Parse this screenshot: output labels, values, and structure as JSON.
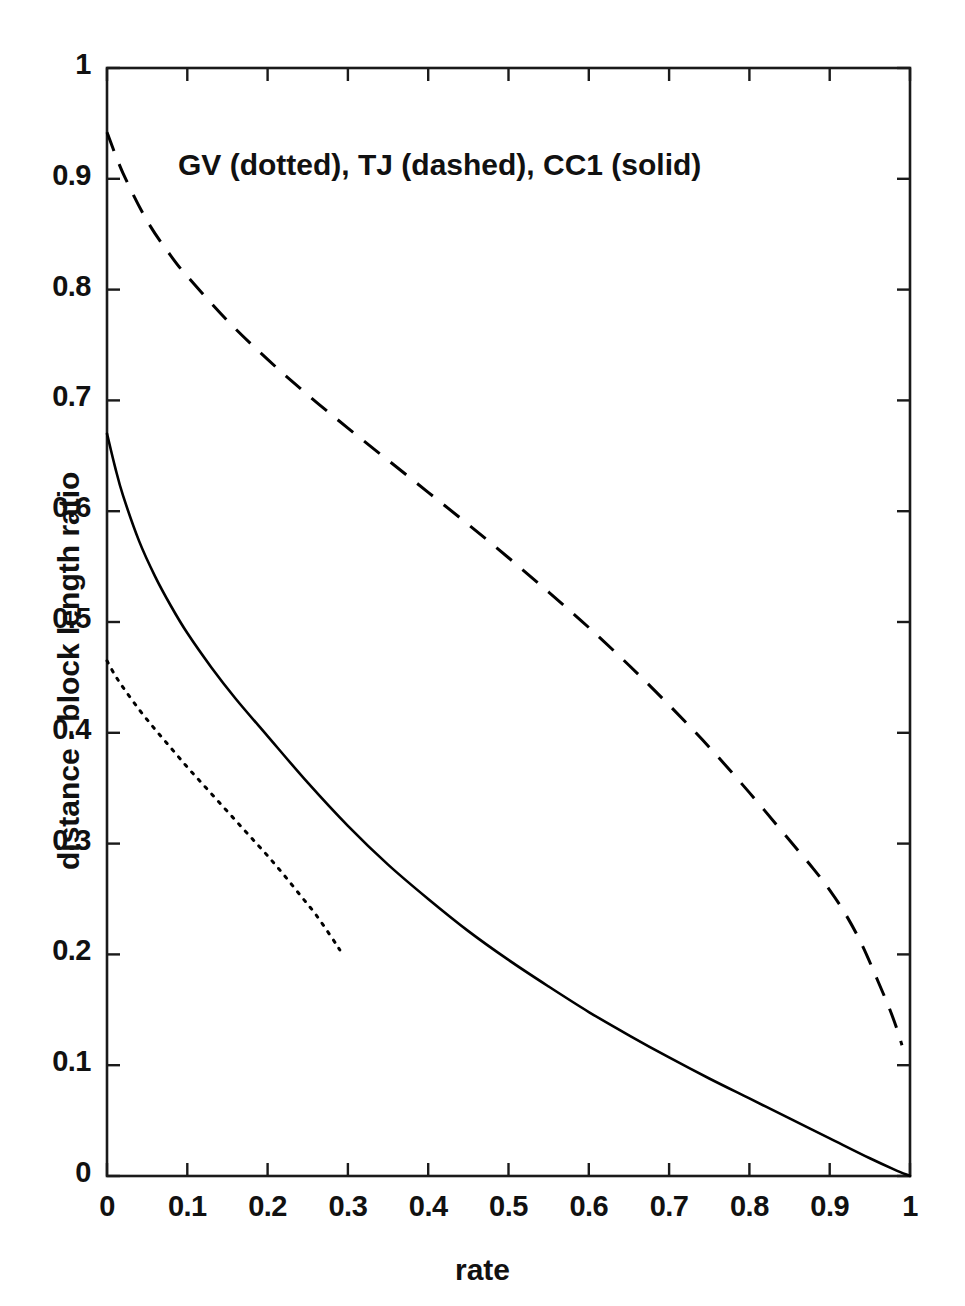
{
  "figure": {
    "annotation": "GV (dotted), TJ (dashed), CC1 (solid)"
  },
  "chart_data": {
    "type": "line",
    "title": "",
    "annotation": "GV (dotted), TJ (dashed), CC1 (solid)",
    "xlabel": "rate",
    "ylabel": "distance - block length ratio",
    "xlim": [
      0,
      1
    ],
    "ylim": [
      0,
      1
    ],
    "grid": false,
    "legend_position": "inside-top-left-as-text-annotation",
    "xticks": [
      "0",
      "0.1",
      "0.2",
      "0.3",
      "0.4",
      "0.5",
      "0.6",
      "0.7",
      "0.8",
      "0.9",
      "1"
    ],
    "xtick_values": [
      0,
      0.1,
      0.2,
      0.3,
      0.4,
      0.5,
      0.6,
      0.7,
      0.8,
      0.9,
      1
    ],
    "yticks": [
      "0",
      "0.1",
      "0.2",
      "0.3",
      "0.4",
      "0.5",
      "0.6",
      "0.7",
      "0.8",
      "0.9",
      "1"
    ],
    "ytick_values": [
      0,
      0.1,
      0.2,
      0.3,
      0.4,
      0.5,
      0.6,
      0.7,
      0.8,
      0.9,
      1
    ],
    "x": [
      0,
      0.02,
      0.05,
      0.1,
      0.15,
      0.2,
      0.25,
      0.3,
      0.35,
      0.4,
      0.45,
      0.5,
      0.55,
      0.6,
      0.65,
      0.7,
      0.75,
      0.8,
      0.85,
      0.9,
      0.93,
      0.95,
      0.97,
      0.98,
      0.99,
      1
    ],
    "series": [
      {
        "name": "GV",
        "style": "dotted",
        "color": "#000000",
        "x": [
          0,
          0.01,
          0.02,
          0.04,
          0.06,
          0.08,
          0.1,
          0.12,
          0.14,
          0.16,
          0.18,
          0.2,
          0.22,
          0.24,
          0.26,
          0.28,
          0.29
        ],
        "values": [
          0.465,
          0.452,
          0.441,
          0.421,
          0.403,
          0.386,
          0.369,
          0.353,
          0.337,
          0.321,
          0.305,
          0.289,
          0.272,
          0.254,
          0.236,
          0.215,
          0.204
        ]
      },
      {
        "name": "TJ",
        "style": "dashed",
        "color": "#000000",
        "x": [
          0,
          0.02,
          0.05,
          0.08,
          0.1,
          0.15,
          0.2,
          0.25,
          0.3,
          0.35,
          0.4,
          0.45,
          0.5,
          0.55,
          0.6,
          0.65,
          0.7,
          0.75,
          0.8,
          0.85,
          0.88,
          0.9,
          0.92,
          0.94,
          0.96,
          0.975,
          0.985,
          0.99
        ],
        "values": [
          0.942,
          0.905,
          0.862,
          0.83,
          0.812,
          0.772,
          0.737,
          0.705,
          0.675,
          0.646,
          0.617,
          0.588,
          0.558,
          0.527,
          0.495,
          0.461,
          0.425,
          0.387,
          0.346,
          0.303,
          0.277,
          0.258,
          0.236,
          0.209,
          0.176,
          0.15,
          0.13,
          0.118
        ]
      },
      {
        "name": "CC1",
        "style": "solid",
        "color": "#000000",
        "x": [
          0,
          0.01,
          0.02,
          0.04,
          0.06,
          0.08,
          0.1,
          0.13,
          0.16,
          0.2,
          0.25,
          0.3,
          0.35,
          0.4,
          0.45,
          0.5,
          0.55,
          0.6,
          0.65,
          0.7,
          0.75,
          0.8,
          0.85,
          0.9,
          0.95,
          0.98,
          1
        ],
        "values": [
          0.67,
          0.64,
          0.614,
          0.573,
          0.541,
          0.514,
          0.49,
          0.459,
          0.431,
          0.397,
          0.355,
          0.316,
          0.281,
          0.25,
          0.221,
          0.195,
          0.171,
          0.148,
          0.127,
          0.107,
          0.088,
          0.07,
          0.052,
          0.034,
          0.016,
          0.006,
          0.0
        ]
      }
    ]
  },
  "axes": {
    "x_title": "rate",
    "y_title": "distance - block length ratio"
  }
}
